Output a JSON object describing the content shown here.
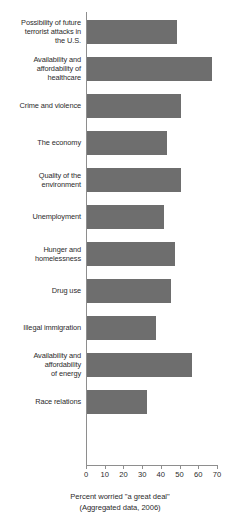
{
  "chart_data": {
    "type": "bar",
    "orientation": "horizontal",
    "title": "",
    "xlabel": "Percent worried \"a great deal\"",
    "ylabel": "",
    "xlim": [
      0,
      70
    ],
    "xticks": [
      0,
      10,
      20,
      30,
      40,
      50,
      60,
      70
    ],
    "grid": false,
    "legend": null,
    "bar_color": "#6e6e6e",
    "axis_color": "#8e8e8e",
    "categories": [
      "Possibility of future terrorist attacks in the U.S.",
      "Availability and affordability of healthcare",
      "Crime and violence",
      "The economy",
      "Quality of the environment",
      "Unemployment",
      "Hunger and homelessness",
      "Drug use",
      "Illegal immigration",
      "Availability and affordability of energy",
      "Race relations"
    ],
    "values": [
      48,
      67,
      50,
      43,
      50,
      41,
      47,
      45,
      37,
      56,
      32
    ],
    "bars": [
      {
        "label": "Possibility of future terrorist attacks in the U.S.",
        "label_lines": [
          "Possibility of future",
          "terrorist attacks in",
          "the U.S."
        ],
        "value": 48
      },
      {
        "label": "Availability and affordability of healthcare",
        "label_lines": [
          "Availability and",
          "affordability of",
          "healthcare"
        ],
        "value": 67
      },
      {
        "label": "Crime and violence",
        "label_lines": [
          "Crime and violence"
        ],
        "value": 50
      },
      {
        "label": "The economy",
        "label_lines": [
          "The economy"
        ],
        "value": 43
      },
      {
        "label": "Quality of the environment",
        "label_lines": [
          "Quality of the",
          "environment"
        ],
        "value": 50
      },
      {
        "label": "Unemployment",
        "label_lines": [
          "Unemployment"
        ],
        "value": 41
      },
      {
        "label": "Hunger and homelessness",
        "label_lines": [
          "Hunger and",
          "homelessness"
        ],
        "value": 47
      },
      {
        "label": "Drug use",
        "label_lines": [
          "Drug use"
        ],
        "value": 45
      },
      {
        "label": "Illegal immigration",
        "label_lines": [
          "Illegal immigration"
        ],
        "value": 37
      },
      {
        "label": "Availability and affordability of energy",
        "label_lines": [
          "Availability and",
          "affordability",
          "of energy"
        ],
        "value": 56
      },
      {
        "label": "Race relations",
        "label_lines": [
          "Race relations"
        ],
        "value": 32
      }
    ],
    "captions": [
      "Percent worried \"a great deal\"",
      "(Aggregated data, 2006)"
    ]
  }
}
